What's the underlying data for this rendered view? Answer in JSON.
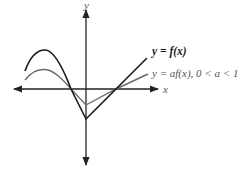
{
  "diagram": {
    "axes": {
      "x_label": "x",
      "y_label": "y"
    },
    "curves": [
      {
        "id": "f",
        "label": "y = f(x)",
        "color": "#1a1a1a",
        "description": "original function: local max on left, crosses x-axis left of origin, V-shaped minimum on y-axis below origin, crosses x-axis right of origin, rises linearly"
      },
      {
        "id": "af",
        "label": "y = af(x), 0 < a < 1",
        "color": "#6b6b6b",
        "description": "vertical compression of f by factor a: same x-intercepts, smaller amplitude"
      }
    ]
  }
}
